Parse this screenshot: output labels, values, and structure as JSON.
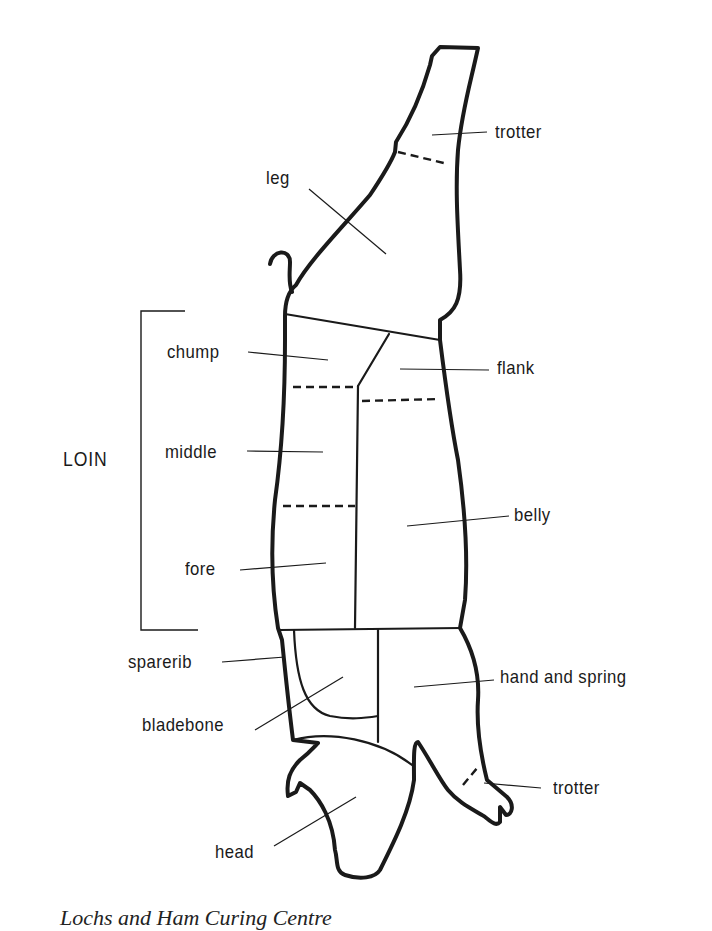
{
  "figure": {
    "caption": "Lochs and Ham Curing Centre"
  },
  "bracket_label": "LOIN",
  "labels": {
    "trotter_hind": "trotter",
    "leg": "leg",
    "chump": "chump",
    "flank": "flank",
    "middle": "middle",
    "belly": "belly",
    "fore": "fore",
    "sparerib": "sparerib",
    "hand_and_spring": "hand and spring",
    "bladebone": "bladebone",
    "trotter_fore": "trotter",
    "head": "head"
  },
  "colors": {
    "ink": "#1a1a1a",
    "paper": "#ffffff"
  }
}
